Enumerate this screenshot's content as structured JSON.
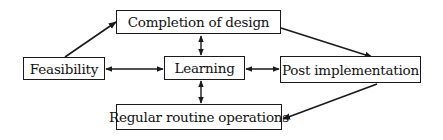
{
  "diagram": {
    "type": "flowchart",
    "nodes": [
      {
        "id": "completion",
        "label": "Completion of design"
      },
      {
        "id": "feasibility",
        "label": "Feasibility"
      },
      {
        "id": "learning",
        "label": "Learning"
      },
      {
        "id": "post",
        "label": "Post implementation"
      },
      {
        "id": "regular",
        "label": "Regular routine operations"
      }
    ],
    "edges": [
      {
        "from": "feasibility",
        "to": "completion",
        "direction": "forward"
      },
      {
        "from": "completion",
        "to": "post",
        "direction": "forward"
      },
      {
        "from": "post",
        "to": "regular",
        "direction": "forward"
      },
      {
        "from": "feasibility",
        "to": "learning",
        "direction": "both"
      },
      {
        "from": "learning",
        "to": "post",
        "direction": "both"
      },
      {
        "from": "completion",
        "to": "learning",
        "direction": "both"
      },
      {
        "from": "learning",
        "to": "regular",
        "direction": "both"
      }
    ],
    "colors": {
      "line": "#1a1a1a",
      "background": "#ffffff"
    }
  }
}
